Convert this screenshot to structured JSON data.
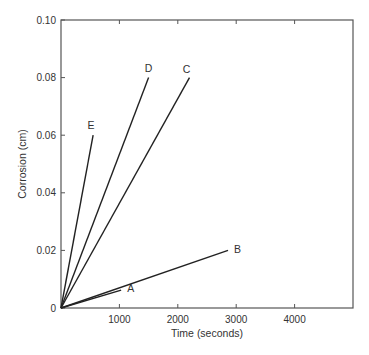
{
  "chart_data": {
    "type": "line",
    "title": "",
    "xlabel": "Time (seconds)",
    "ylabel": "Corrosion (cm)",
    "xlim": [
      0,
      5000
    ],
    "ylim": [
      0,
      0.1
    ],
    "grid": false,
    "legend": "inline labels at line ends",
    "x_ticks": [
      1000,
      2000,
      3000,
      4000
    ],
    "x_tick_labels": [
      "1000",
      "2000",
      "3000",
      "4000"
    ],
    "y_ticks": [
      0,
      0.02,
      0.04,
      0.06,
      0.08,
      0.1
    ],
    "y_tick_labels": [
      "0",
      "0.02",
      "0.04",
      "0.06",
      "0.08",
      "0.10"
    ],
    "series": [
      {
        "name": "A",
        "x": [
          0,
          1030
        ],
        "y": [
          0,
          0.0062
        ]
      },
      {
        "name": "B",
        "x": [
          0,
          2860
        ],
        "y": [
          0,
          0.02
        ]
      },
      {
        "name": "C",
        "x": [
          0,
          2200
        ],
        "y": [
          0,
          0.08
        ]
      },
      {
        "name": "D",
        "x": [
          0,
          1500
        ],
        "y": [
          0,
          0.08
        ]
      },
      {
        "name": "E",
        "x": [
          0,
          550
        ],
        "y": [
          0,
          0.06
        ]
      }
    ]
  }
}
